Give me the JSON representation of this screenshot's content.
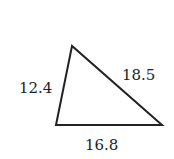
{
  "diagram": {
    "type": "triangle",
    "vertices": {
      "top": [
        72,
        46
      ],
      "bottom_left": [
        56,
        125
      ],
      "bottom_right": [
        162,
        125
      ]
    },
    "sides": {
      "left": "12.4",
      "right": "18.5",
      "bottom": "16.8"
    },
    "stroke_color": "#222222"
  }
}
